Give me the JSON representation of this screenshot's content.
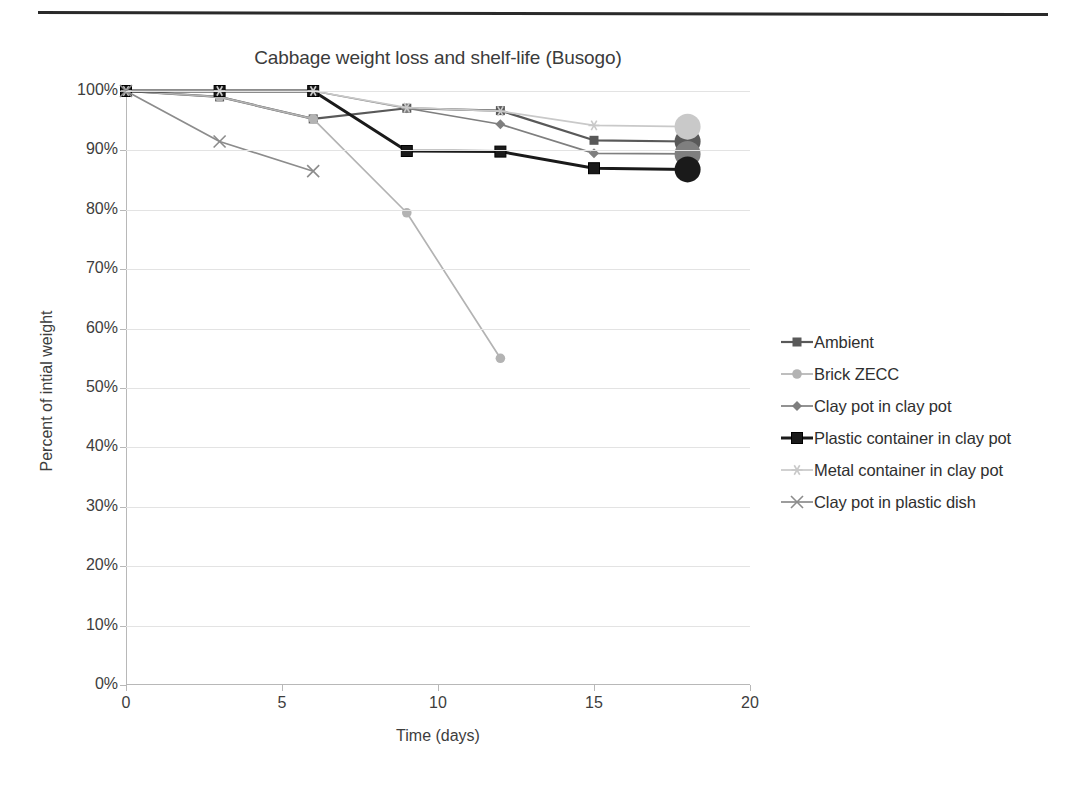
{
  "chart_data": {
    "type": "line",
    "title": "Cabbage weight loss and shelf-life (Busogo)",
    "xlabel": "Time (days)",
    "ylabel": "Percent of intial weight",
    "xlim": [
      0,
      20
    ],
    "ylim": [
      0,
      100
    ],
    "xticks": [
      0,
      5,
      10,
      15,
      20
    ],
    "xticklabels": [
      "0",
      "5",
      "10",
      "15",
      "20"
    ],
    "yticks": [
      0,
      10,
      20,
      30,
      40,
      50,
      60,
      70,
      80,
      90,
      100
    ],
    "yticklabels": [
      "0%",
      "10%",
      "20%",
      "30%",
      "40%",
      "50%",
      "60%",
      "70%",
      "80%",
      "90%",
      "100%"
    ],
    "grid": "horizontal",
    "legend_position": "right",
    "series": [
      {
        "name": "Ambient",
        "color": "#595959",
        "marker": "square",
        "x": [
          0,
          3,
          6,
          9,
          12,
          15,
          18
        ],
        "y": [
          100,
          99,
          95.3,
          97.1,
          96.7,
          91.7,
          91.5
        ],
        "endpoint_marker": "large-circle"
      },
      {
        "name": "Brick ZECC",
        "color": "#b3b3b3",
        "marker": "circle",
        "x": [
          0,
          3,
          6,
          9,
          12
        ],
        "y": [
          100,
          99,
          95.3,
          79.5,
          55
        ],
        "endpoint_marker": "none"
      },
      {
        "name": "Clay pot in clay pot",
        "color": "#7f7f7f",
        "marker": "diamond",
        "x": [
          0,
          3,
          6,
          9,
          12,
          15,
          18
        ],
        "y": [
          100,
          100,
          100,
          97.1,
          94.4,
          89.5,
          89.4
        ],
        "endpoint_marker": "large-circle"
      },
      {
        "name": "Plastic container in clay pot",
        "color": "#1a1a1a",
        "marker": "square-bold",
        "x": [
          0,
          3,
          6,
          9,
          12,
          15,
          18
        ],
        "y": [
          100,
          100,
          100,
          89.9,
          89.8,
          87.0,
          86.8
        ],
        "endpoint_marker": "large-circle"
      },
      {
        "name": "Metal container in clay pot",
        "color": "#c9c9c9",
        "marker": "star",
        "x": [
          0,
          3,
          6,
          9,
          12,
          15,
          18
        ],
        "y": [
          100,
          100,
          100,
          97.2,
          96.6,
          94.2,
          94.0
        ],
        "endpoint_marker": "large-circle"
      },
      {
        "name": "Clay pot in plastic dish",
        "color": "#8c8c8c",
        "marker": "x",
        "x": [
          0,
          3,
          6
        ],
        "y": [
          100,
          91.5,
          86.5
        ],
        "endpoint_marker": "none"
      }
    ]
  },
  "legend": {
    "items": [
      {
        "label": "Ambient",
        "marker": "square",
        "color": "#595959"
      },
      {
        "label": "Brick ZECC",
        "marker": "circle",
        "color": "#b3b3b3"
      },
      {
        "label": "Clay pot in clay pot",
        "marker": "diamond",
        "color": "#7f7f7f"
      },
      {
        "label": "Plastic container in clay pot",
        "marker": "square-bold",
        "color": "#1a1a1a"
      },
      {
        "label": "Metal container in clay pot",
        "marker": "star",
        "color": "#c9c9c9"
      },
      {
        "label": "Clay pot in plastic dish",
        "marker": "x",
        "color": "#8c8c8c"
      }
    ]
  }
}
